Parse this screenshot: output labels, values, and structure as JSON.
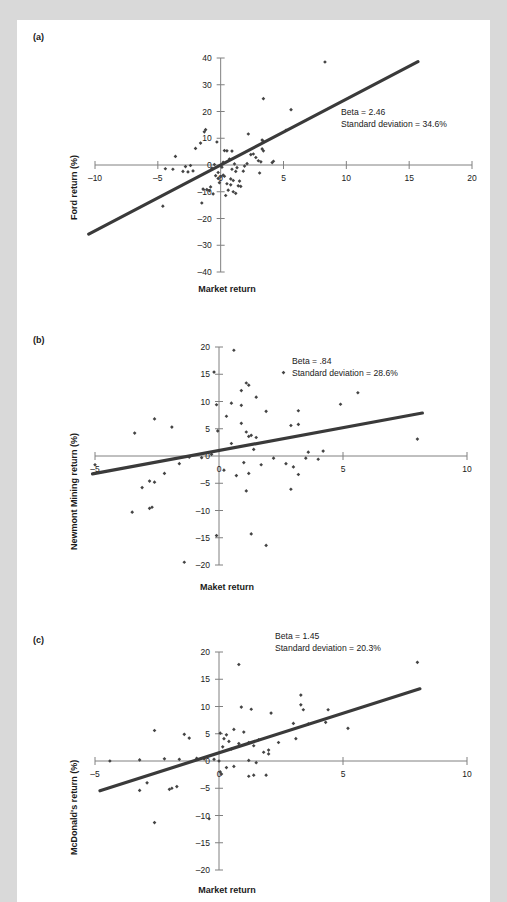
{
  "figure": {
    "background_color": "#d9d9d9",
    "card_color": "#ffffff",
    "line_color": "#3a3a3a",
    "point_color": "#444444",
    "axis_color": "#808080"
  },
  "panels": [
    {
      "label": "(a)",
      "annotation_beta": "Beta = 2.46",
      "annotation_sd": "Standard deviation = 34.6%",
      "xlabel": "Market return",
      "ylabel": "Ford return (%)"
    },
    {
      "label": "(b)",
      "annotation_beta": "Beta = .84",
      "annotation_sd": "Standard deviation = 28.6%",
      "xlabel": "Maket return",
      "ylabel": "Newmont Mining return (%)"
    },
    {
      "label": "(c)",
      "annotation_beta": "Beta = 1.45",
      "annotation_sd": "Standard deviation = 20.3%",
      "xlabel": "Market return",
      "ylabel": "McDonald's return (%)"
    }
  ],
  "chart_data": [
    {
      "type": "scatter",
      "title": "(a)",
      "xlabel": "Market return",
      "ylabel": "Ford return (%)",
      "xlim": [
        -10,
        20
      ],
      "ylim": [
        -40,
        40
      ],
      "xticks": [
        -10,
        -5,
        0,
        5,
        10,
        15,
        20
      ],
      "yticks": [
        40,
        30,
        20,
        10,
        0,
        -10,
        -20,
        -30,
        -40
      ],
      "grid": false,
      "legend": null,
      "annotations": [
        "Beta = 2.46",
        "Standard deviation = 34.6%"
      ],
      "fit_line": {
        "beta": 2.46,
        "intercept": 0.0,
        "x_from": -10.5,
        "x_to": 15.7
      },
      "points": [
        [
          8.3,
          38.5
        ],
        [
          3.4,
          24.8
        ],
        [
          5.6,
          20.7
        ],
        [
          -1.2,
          13.2
        ],
        [
          -1.3,
          12.4
        ],
        [
          5.2,
          13.0
        ],
        [
          2.2,
          11.6
        ],
        [
          3.3,
          9.3
        ],
        [
          3.4,
          8.8
        ],
        [
          -0.3,
          8.6
        ],
        [
          -1.6,
          8.2
        ],
        [
          -2.0,
          6.2
        ],
        [
          3.3,
          6.0
        ],
        [
          3.4,
          5.3
        ],
        [
          0.3,
          5.4
        ],
        [
          0.5,
          5.3
        ],
        [
          0.9,
          5.2
        ],
        [
          -3.6,
          3.2
        ],
        [
          2.8,
          2.8
        ],
        [
          3.0,
          1.6
        ],
        [
          3.2,
          1.2
        ],
        [
          4.1,
          0.9
        ],
        [
          4.2,
          1.4
        ],
        [
          -4.4,
          -1.4
        ],
        [
          -3.8,
          -1.6
        ],
        [
          -3.0,
          -2.4
        ],
        [
          -2.6,
          -2.6
        ],
        [
          -2.2,
          -2.2
        ],
        [
          1.2,
          -2.4
        ],
        [
          1.8,
          -2.3
        ],
        [
          3.1,
          -3.0
        ],
        [
          0.2,
          -3.8
        ],
        [
          0.3,
          -4.2
        ],
        [
          0.0,
          -4.4
        ],
        [
          -0.4,
          -4.0
        ],
        [
          -0.2,
          -5.0
        ],
        [
          0.8,
          -5.2
        ],
        [
          1.0,
          -5.8
        ],
        [
          1.5,
          -6.0
        ],
        [
          -0.1,
          -6.6
        ],
        [
          0.5,
          -7.0
        ],
        [
          0.8,
          -7.4
        ],
        [
          1.4,
          -7.8
        ],
        [
          1.6,
          -8.0
        ],
        [
          -1.4,
          -9.0
        ],
        [
          -1.1,
          -9.2
        ],
        [
          -0.9,
          -9.6
        ],
        [
          0.6,
          -9.4
        ],
        [
          1.0,
          -10.0
        ],
        [
          1.2,
          -10.6
        ],
        [
          -0.6,
          -10.8
        ],
        [
          0.4,
          -11.4
        ],
        [
          -1.5,
          -14.2
        ],
        [
          -4.6,
          -15.4
        ],
        [
          -0.8,
          -8.2
        ],
        [
          0.1,
          -0.8
        ],
        [
          -0.5,
          0.2
        ],
        [
          0.2,
          1.0
        ],
        [
          1.1,
          0.4
        ],
        [
          2.4,
          3.9
        ],
        [
          2.6,
          4.1
        ],
        [
          -2.8,
          -0.6
        ],
        [
          -2.4,
          -0.2
        ],
        [
          1.9,
          -0.4
        ],
        [
          2.1,
          0.5
        ],
        [
          0.7,
          2.2
        ],
        [
          -0.7,
          -1.2
        ],
        [
          1.3,
          -1.0
        ],
        [
          0.9,
          -1.6
        ],
        [
          -0.2,
          -2.8
        ]
      ]
    },
    {
      "type": "scatter",
      "title": "(b)",
      "xlabel": "Maket return",
      "ylabel": "Newmont Mining return (%)",
      "xlim": [
        -5,
        10
      ],
      "ylim": [
        -20,
        20
      ],
      "xticks": [
        -5,
        0,
        5,
        10
      ],
      "yticks": [
        20,
        15,
        10,
        5,
        0,
        -5,
        -10,
        -15,
        -20
      ],
      "grid": false,
      "legend": null,
      "annotations": [
        "Beta = .84",
        "Standard deviation = 28.6%"
      ],
      "fit_line": {
        "beta": 0.84,
        "intercept": 1.0,
        "x_from": -5.1,
        "x_to": 8.2
      },
      "points": [
        [
          0.6,
          19.4
        ],
        [
          -0.2,
          15.4
        ],
        [
          2.6,
          15.3
        ],
        [
          1.1,
          13.4
        ],
        [
          1.2,
          13.0
        ],
        [
          0.9,
          12.0
        ],
        [
          1.5,
          10.8
        ],
        [
          5.6,
          11.6
        ],
        [
          4.9,
          9.5
        ],
        [
          -0.1,
          9.4
        ],
        [
          0.5,
          9.7
        ],
        [
          0.9,
          9.3
        ],
        [
          1.9,
          8.2
        ],
        [
          3.2,
          8.3
        ],
        [
          0.3,
          7.3
        ],
        [
          -2.6,
          6.8
        ],
        [
          -3.4,
          4.2
        ],
        [
          -1.9,
          5.3
        ],
        [
          0.9,
          6.0
        ],
        [
          2.9,
          5.6
        ],
        [
          3.2,
          5.8
        ],
        [
          -0.05,
          4.6
        ],
        [
          1.1,
          4.4
        ],
        [
          1.3,
          3.8
        ],
        [
          1.5,
          3.4
        ],
        [
          1.2,
          3.6
        ],
        [
          8.0,
          3.1
        ],
        [
          0.5,
          2.3
        ],
        [
          1.4,
          1.2
        ],
        [
          3.6,
          0.7
        ],
        [
          -1.2,
          -0.2
        ],
        [
          -0.7,
          -0.3
        ],
        [
          2.2,
          -0.4
        ],
        [
          3.5,
          -0.4
        ],
        [
          4.0,
          -0.6
        ],
        [
          -1.6,
          -1.4
        ],
        [
          1.0,
          -1.2
        ],
        [
          1.7,
          -1.6
        ],
        [
          2.7,
          -1.4
        ],
        [
          3.0,
          -2.0
        ],
        [
          -5.0,
          -1.6
        ],
        [
          -2.2,
          -3.2
        ],
        [
          0.2,
          -2.6
        ],
        [
          0.7,
          -3.6
        ],
        [
          1.2,
          -3.2
        ],
        [
          3.2,
          -3.4
        ],
        [
          -2.8,
          -4.6
        ],
        [
          -2.6,
          -4.8
        ],
        [
          -3.1,
          -5.8
        ],
        [
          1.1,
          -6.4
        ],
        [
          2.9,
          -6.1
        ],
        [
          -2.8,
          -9.6
        ],
        [
          -2.7,
          -9.4
        ],
        [
          -3.5,
          -10.3
        ],
        [
          -0.1,
          -14.6
        ],
        [
          1.3,
          -14.3
        ],
        [
          1.9,
          -16.4
        ],
        [
          -1.4,
          -19.5
        ],
        [
          4.2,
          0.9
        ],
        [
          -0.3,
          0.3
        ]
      ]
    },
    {
      "type": "scatter",
      "title": "(c)",
      "xlabel": "Market return",
      "ylabel": "McDonald's return (%)",
      "xlim": [
        -5,
        10
      ],
      "ylim": [
        -20,
        20
      ],
      "xticks": [
        -5,
        0,
        5,
        10
      ],
      "yticks": [
        20,
        15,
        10,
        5,
        0,
        -5,
        -10,
        -15,
        -20
      ],
      "grid": false,
      "legend": null,
      "annotations": [
        "Beta = 1.45",
        "Standard deviation = 20.3%"
      ],
      "fit_line": {
        "beta": 1.45,
        "intercept": 1.5,
        "x_from": -4.8,
        "x_to": 8.1
      },
      "points": [
        [
          0.8,
          17.7
        ],
        [
          8.0,
          18.1
        ],
        [
          3.3,
          12.1
        ],
        [
          3.3,
          10.3
        ],
        [
          0.9,
          9.9
        ],
        [
          1.3,
          9.5
        ],
        [
          3.4,
          9.4
        ],
        [
          4.4,
          9.4
        ],
        [
          2.1,
          8.8
        ],
        [
          3.0,
          6.9
        ],
        [
          3.6,
          6.8
        ],
        [
          4.3,
          7.1
        ],
        [
          5.2,
          6.0
        ],
        [
          0.6,
          5.8
        ],
        [
          1.0,
          5.3
        ],
        [
          0.05,
          5.1
        ],
        [
          0.3,
          4.8
        ],
        [
          -2.6,
          5.6
        ],
        [
          -1.4,
          4.9
        ],
        [
          -1.2,
          4.2
        ],
        [
          1.6,
          3.9
        ],
        [
          0.2,
          4.1
        ],
        [
          0.4,
          3.6
        ],
        [
          0.8,
          3.2
        ],
        [
          1.2,
          3.4
        ],
        [
          1.4,
          2.8
        ],
        [
          2.4,
          3.4
        ],
        [
          3.1,
          4.1
        ],
        [
          0.15,
          2.6
        ],
        [
          0.5,
          2.2
        ],
        [
          1.8,
          1.6
        ],
        [
          2.0,
          1.3
        ],
        [
          -0.6,
          0.4
        ],
        [
          -0.2,
          0.3
        ],
        [
          -1.6,
          0.3
        ],
        [
          -2.2,
          0.4
        ],
        [
          -3.2,
          0.2
        ],
        [
          -4.4,
          0.0
        ],
        [
          1.2,
          0.1
        ],
        [
          1.5,
          -0.3
        ],
        [
          0.3,
          -1.2
        ],
        [
          0.6,
          -1.0
        ],
        [
          1.2,
          -2.8
        ],
        [
          1.4,
          -2.6
        ],
        [
          1.9,
          -2.6
        ],
        [
          0.05,
          -2.0
        ],
        [
          0.1,
          -2.4
        ],
        [
          -2.9,
          -4.0
        ],
        [
          -3.2,
          -5.4
        ],
        [
          -2.0,
          -5.2
        ],
        [
          -1.9,
          -5.0
        ],
        [
          -1.7,
          -4.7
        ],
        [
          -0.4,
          -10.6
        ],
        [
          -2.6,
          -11.3
        ],
        [
          2.0,
          2.0
        ],
        [
          -0.9,
          0.5
        ],
        [
          0.0,
          0.0
        ]
      ]
    }
  ]
}
